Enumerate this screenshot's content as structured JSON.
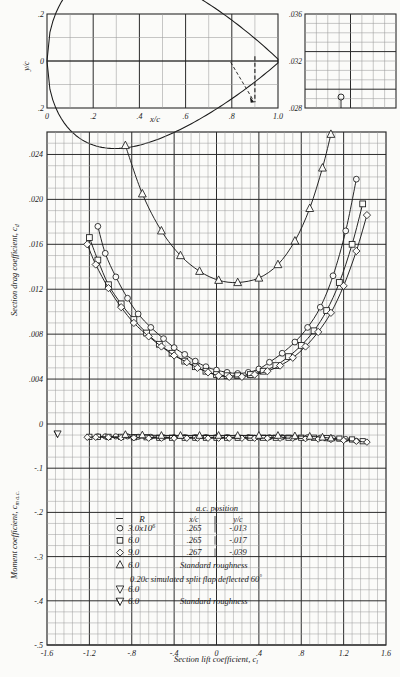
{
  "figure": {
    "kind": "naca-airfoil-characteristics",
    "background": "#fbfbf9",
    "ink": "#1a1a1a",
    "grid_minor": "#9a9a9a",
    "grid_major": "#2b2b2b"
  },
  "airfoil_inset": {
    "ylabel": "y/c",
    "xlabel": "x/c",
    "y_ticks": [
      ".2",
      "0",
      ".2"
    ],
    "y_tick_values": [
      0.2,
      0,
      -0.2
    ],
    "x_ticks": [
      "0",
      ".2",
      ".4",
      ".6",
      ".8",
      "1.0"
    ],
    "x_tick_values": [
      0,
      0.2,
      0.4,
      0.6,
      0.8,
      1.0
    ],
    "flap_hinge_x": 0.8,
    "flap_marker_x": 0.9
  },
  "right_inset": {
    "ticks": [
      ".036",
      ".032",
      ".028"
    ],
    "tick_values": [
      0.036,
      0.032,
      0.028
    ]
  },
  "drag_axis": {
    "label": "Section drag coefficient, c",
    "label_sub": "d",
    "ticks": [
      ".024",
      ".020",
      ".016",
      ".012",
      ".008",
      ".004",
      "0"
    ],
    "tick_values": [
      0.024,
      0.02,
      0.016,
      0.012,
      0.008,
      0.004,
      0.0
    ],
    "range": [
      0.0,
      0.026
    ]
  },
  "moment_axis": {
    "label": "Moment coefficient, c",
    "label_sub": "m a.c.",
    "ticks": [
      "0",
      "-.1",
      "-.2",
      "-.3",
      "-.4",
      "-.5"
    ],
    "tick_values": [
      0,
      -0.1,
      -0.2,
      -0.3,
      -0.4,
      -0.5
    ],
    "range": [
      -0.5,
      0.0
    ]
  },
  "lift_axis": {
    "label": "Section lift coefficient, c",
    "label_sub": "l",
    "ticks": [
      "-1.6",
      "-1.2",
      "-.8",
      "-.4",
      "0",
      ".4",
      ".8",
      "1.2",
      "1.6"
    ],
    "tick_values": [
      -1.6,
      -1.2,
      -0.8,
      -0.4,
      0,
      0.4,
      0.8,
      1.2,
      1.6
    ],
    "range": [
      -1.6,
      1.6
    ]
  },
  "legend": {
    "r_header": "R",
    "ac_header": "a.c. position",
    "col_xc": "x/c",
    "col_yc": "y/c",
    "rows": [
      {
        "symbol": "circle",
        "R": "3.0x10",
        "exp": "6",
        "xc": ".265",
        "yc": "-.013",
        "note": ""
      },
      {
        "symbol": "square",
        "R": "6.0",
        "exp": "",
        "xc": ".265",
        "yc": "-.017",
        "note": ""
      },
      {
        "symbol": "diamond",
        "R": "9.0",
        "exp": "",
        "xc": ".267",
        "yc": "-.039",
        "note": ""
      },
      {
        "symbol": "triangle-up",
        "R": "6.0",
        "exp": "",
        "xc": "",
        "yc": "",
        "note": "Standard roughness"
      },
      {
        "symbol": "triangle-down",
        "R": "6.0",
        "exp": "",
        "xc": "",
        "yc": "",
        "note": ""
      },
      {
        "symbol": "triangle-down-flag",
        "R": "6.0",
        "exp": "",
        "xc": "",
        "yc": "",
        "note": "Standard roughness"
      }
    ],
    "flap_note": "0.20c simulated split flap deflected 60",
    "flap_note_deg": "°"
  },
  "chart_data": {
    "type": "scatter",
    "title": "",
    "xlabel": "Section lift coefficient, c_l",
    "ylabel": "Section drag coefficient, c_d",
    "xlim": [
      -1.6,
      1.6
    ],
    "ylim": [
      0.0,
      0.026
    ],
    "ylim_moment": [
      -0.5,
      0.0
    ],
    "grid": true,
    "legend_position": "lower-center",
    "series": [
      {
        "name": "R = 3.0x10^6",
        "symbol": "circle",
        "x": [
          -1.12,
          -1.05,
          -0.95,
          -0.84,
          -0.74,
          -0.62,
          -0.5,
          -0.4,
          -0.3,
          -0.2,
          -0.1,
          0.0,
          0.1,
          0.2,
          0.3,
          0.4,
          0.5,
          0.62,
          0.74,
          0.86,
          0.98,
          1.1,
          1.22,
          1.32
        ],
        "cd": [
          0.0176,
          0.0152,
          0.0131,
          0.0112,
          0.0098,
          0.0086,
          0.0076,
          0.0068,
          0.0062,
          0.0056,
          0.0051,
          0.0048,
          0.0046,
          0.0045,
          0.0046,
          0.0049,
          0.0055,
          0.0063,
          0.0073,
          0.0086,
          0.0104,
          0.0132,
          0.0172,
          0.0218
        ],
        "cm": [
          -0.028,
          -0.028,
          -0.028,
          -0.028,
          -0.029,
          -0.029,
          -0.03,
          -0.03,
          -0.03,
          -0.03,
          -0.03,
          -0.03,
          -0.03,
          -0.03,
          -0.03,
          -0.03,
          -0.03,
          -0.03,
          -0.03,
          -0.03,
          -0.031,
          -0.032,
          -0.034,
          -0.038
        ]
      },
      {
        "name": "R = 6.0x10^6",
        "symbol": "square",
        "x": [
          -1.2,
          -1.12,
          -1.02,
          -0.9,
          -0.78,
          -0.66,
          -0.54,
          -0.42,
          -0.3,
          -0.2,
          -0.1,
          0.0,
          0.1,
          0.2,
          0.32,
          0.44,
          0.56,
          0.68,
          0.8,
          0.92,
          1.04,
          1.16,
          1.28,
          1.38
        ],
        "cd": [
          0.0166,
          0.0146,
          0.0124,
          0.0107,
          0.0093,
          0.0081,
          0.0071,
          0.0063,
          0.0056,
          0.0051,
          0.0047,
          0.0044,
          0.0043,
          0.0043,
          0.0044,
          0.0047,
          0.0052,
          0.006,
          0.007,
          0.0083,
          0.0101,
          0.0126,
          0.016,
          0.0196
        ],
        "cm": [
          -0.029,
          -0.029,
          -0.029,
          -0.029,
          -0.03,
          -0.03,
          -0.031,
          -0.031,
          -0.031,
          -0.031,
          -0.031,
          -0.031,
          -0.031,
          -0.031,
          -0.031,
          -0.031,
          -0.031,
          -0.031,
          -0.031,
          -0.031,
          -0.032,
          -0.033,
          -0.035,
          -0.039
        ]
      },
      {
        "name": "R = 9.0x10^6",
        "symbol": "diamond",
        "x": [
          -1.22,
          -1.14,
          -1.02,
          -0.9,
          -0.78,
          -0.64,
          -0.52,
          -0.4,
          -0.28,
          -0.18,
          -0.08,
          0.02,
          0.12,
          0.24,
          0.36,
          0.48,
          0.6,
          0.72,
          0.84,
          0.96,
          1.08,
          1.2,
          1.32,
          1.42
        ],
        "cd": [
          0.016,
          0.0142,
          0.0121,
          0.0104,
          0.009,
          0.0078,
          0.0069,
          0.0061,
          0.0055,
          0.005,
          0.0046,
          0.0043,
          0.0042,
          0.0042,
          0.0044,
          0.0047,
          0.0052,
          0.0059,
          0.0069,
          0.0082,
          0.0099,
          0.0123,
          0.0154,
          0.0186
        ],
        "cm": [
          -0.03,
          -0.03,
          -0.03,
          -0.031,
          -0.031,
          -0.032,
          -0.032,
          -0.032,
          -0.032,
          -0.032,
          -0.032,
          -0.032,
          -0.032,
          -0.032,
          -0.032,
          -0.032,
          -0.032,
          -0.032,
          -0.033,
          -0.034,
          -0.035,
          -0.037,
          -0.039,
          -0.041
        ]
      },
      {
        "name": "R = 6.0x10^6, standard roughness",
        "symbol": "triangle-up",
        "x": [
          -0.86,
          -0.7,
          -0.52,
          -0.34,
          -0.16,
          0.02,
          0.2,
          0.4,
          0.58,
          0.74,
          0.88,
          1.0,
          1.08
        ],
        "cd": [
          0.0248,
          0.0205,
          0.0172,
          0.015,
          0.0136,
          0.0128,
          0.0126,
          0.013,
          0.0142,
          0.0163,
          0.0192,
          0.0228,
          0.0258
        ],
        "cm": [
          -0.024,
          -0.025,
          -0.026,
          -0.026,
          -0.026,
          -0.026,
          -0.026,
          -0.026,
          -0.026,
          -0.027,
          -0.028,
          -0.03,
          -0.032
        ]
      }
    ],
    "moment_note": "Moment coefficients lie between -0.02 and -0.04 across the full lift range"
  }
}
